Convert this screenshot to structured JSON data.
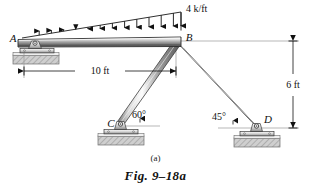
{
  "figure": {
    "subfig_label": "(a)",
    "caption": "Fig. 9–18a"
  },
  "nodes": {
    "a": "A",
    "b": "B",
    "c": "C",
    "d": "D"
  },
  "loads": {
    "distributed_label": "4 k/ft",
    "distributed_peak_value": 4,
    "distributed_units": "k/ft",
    "distributed_shape": "triangular",
    "arrow_count": 13
  },
  "dimensions": {
    "span_ab": "10 ft",
    "height_bd": "6 ft"
  },
  "angles": {
    "at_c": "60°",
    "at_d": "45°"
  },
  "colors": {
    "line": "#1a1a1a",
    "member_light": "#f2f2f2",
    "member_mid": "#b8b8b8",
    "member_dark": "#6e6e6e",
    "ground": "#c9c9c9",
    "thin_rule": "#8a8a8a"
  },
  "supports": {
    "a_type": "pin",
    "c_type": "pin",
    "d_type": "pin"
  }
}
